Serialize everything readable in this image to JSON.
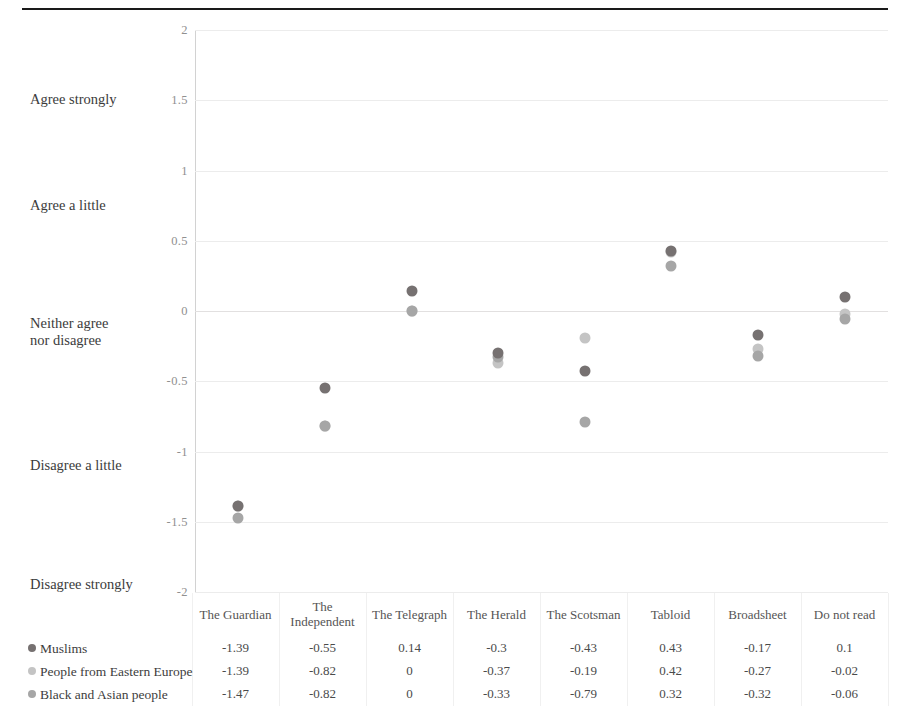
{
  "chart_data": {
    "type": "scatter",
    "title": "",
    "xlabel": "",
    "ylabel": "",
    "ylim": [
      -2,
      2
    ],
    "grid": true,
    "legend_position": "bottom-left-table",
    "categories": [
      "The Guardian",
      "The Independent",
      "The Telegraph",
      "The Herald",
      "The Scotsman",
      "Tabloid",
      "Broadsheet",
      "Do not read"
    ],
    "y_ticks": [
      2,
      1.5,
      1,
      0.5,
      0,
      -0.5,
      -1,
      -1.5,
      -2
    ],
    "y_tick_labels": [
      "2",
      "1.5",
      "1",
      "0.5",
      "0",
      "-0.5",
      "-1",
      "-1.5",
      "-2"
    ],
    "y_anchor_labels": [
      {
        "value": 1.5,
        "text": "Agree strongly"
      },
      {
        "value": 0.75,
        "text": "Agree a little"
      },
      {
        "value": -0.15,
        "text": "Neither agree\nnor disagree"
      },
      {
        "value": -1.1,
        "text": "Disagree a little"
      },
      {
        "value": -1.95,
        "text": "Disagree strongly"
      }
    ],
    "series": [
      {
        "name": "Muslims",
        "color": "#767171",
        "values": [
          -1.39,
          -0.55,
          0.14,
          -0.3,
          -0.43,
          0.43,
          -0.17,
          0.1
        ]
      },
      {
        "name": "People from Eastern Europe",
        "color": "#c4c4c4",
        "values": [
          -1.39,
          -0.82,
          0,
          -0.37,
          -0.19,
          0.42,
          -0.27,
          -0.02
        ]
      },
      {
        "name": "Black and Asian people",
        "color": "#a6a6a6",
        "values": [
          -1.47,
          -0.82,
          0,
          -0.33,
          -0.79,
          0.32,
          -0.32,
          -0.06
        ]
      }
    ]
  },
  "table": {
    "series_header": "",
    "column_headers": [
      "The Guardian",
      "The Independent",
      "The Telegraph",
      "The Herald",
      "The Scotsman",
      "Tabloid",
      "Broadsheet",
      "Do not read"
    ],
    "rows": [
      {
        "label": "Muslims",
        "color": "#767171",
        "values": [
          "-1.39",
          "-0.55",
          "0.14",
          "-0.3",
          "-0.43",
          "0.43",
          "-0.17",
          "0.1"
        ]
      },
      {
        "label": "People from Eastern Europe",
        "color": "#c4c4c4",
        "values": [
          "-1.39",
          "-0.82",
          "0",
          "-0.37",
          "-0.19",
          "0.42",
          "-0.27",
          "-0.02"
        ]
      },
      {
        "label": "Black and Asian people",
        "color": "#a6a6a6",
        "values": [
          "-1.47",
          "-0.82",
          "0",
          "-0.33",
          "-0.79",
          "0.32",
          "-0.32",
          "-0.06"
        ]
      }
    ]
  }
}
